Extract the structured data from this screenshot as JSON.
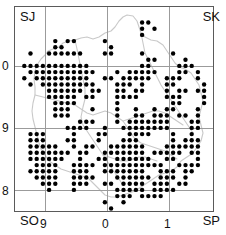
{
  "map": {
    "title": "Species distribution dot map",
    "quadrant_labels": {
      "top_left": "SJ",
      "top_right": "SK",
      "bottom_left": "SO",
      "bottom_right": "SP"
    },
    "axes": {
      "y_ticks": [
        "0",
        "9",
        "8"
      ],
      "x_ticks": [
        "9",
        "0",
        "1"
      ],
      "x_label": "",
      "y_label": ""
    },
    "style": {
      "dot_color": "#000000",
      "grid_color": "#9b9b9b",
      "frame_color": "#5a5a5a",
      "boundary_color": "#c8c8c8",
      "background": "#ffffff"
    }
  },
  "chart_data": {
    "type": "scatter",
    "xlabel": "",
    "ylabel": "",
    "grid": true,
    "legend": null,
    "xlim": [
      0,
      32
    ],
    "ylim": [
      0,
      33
    ],
    "x_tick_values": [
      5,
      15,
      25
    ],
    "x_tick_labels": [
      "9",
      "0",
      "1"
    ],
    "y_tick_values": [
      9,
      19,
      29
    ],
    "y_tick_labels": [
      "0",
      "9",
      "8"
    ],
    "grid_cell_px": 6.2,
    "marker": "filled-circle",
    "marker_size_px": 4.4,
    "points": [
      [
        20,
        2
      ],
      [
        21,
        2
      ],
      [
        20,
        3
      ],
      [
        22,
        3
      ],
      [
        20,
        4
      ],
      [
        6,
        5
      ],
      [
        8,
        5
      ],
      [
        9,
        5
      ],
      [
        14,
        5
      ],
      [
        6,
        6
      ],
      [
        7,
        6
      ],
      [
        15,
        6
      ],
      [
        20,
        7
      ],
      [
        2,
        7
      ],
      [
        5,
        7
      ],
      [
        6,
        7
      ],
      [
        7,
        7
      ],
      [
        8,
        7
      ],
      [
        9,
        7
      ],
      [
        10,
        7
      ],
      [
        14,
        7
      ],
      [
        15,
        7
      ],
      [
        25,
        7
      ],
      [
        21,
        8
      ],
      [
        22,
        8
      ],
      [
        27,
        8
      ],
      [
        1,
        9
      ],
      [
        2,
        9
      ],
      [
        3,
        9
      ],
      [
        4,
        9
      ],
      [
        5,
        9
      ],
      [
        6,
        9
      ],
      [
        7,
        9
      ],
      [
        8,
        9
      ],
      [
        9,
        9
      ],
      [
        10,
        9
      ],
      [
        11,
        9
      ],
      [
        20,
        9
      ],
      [
        21,
        9
      ],
      [
        26,
        9
      ],
      [
        27,
        9
      ],
      [
        28,
        9
      ],
      [
        2,
        10
      ],
      [
        3,
        10
      ],
      [
        4,
        10
      ],
      [
        5,
        10
      ],
      [
        6,
        10
      ],
      [
        7,
        10
      ],
      [
        8,
        10
      ],
      [
        9,
        10
      ],
      [
        10,
        10
      ],
      [
        11,
        10
      ],
      [
        12,
        10
      ],
      [
        16,
        10
      ],
      [
        18,
        10
      ],
      [
        19,
        10
      ],
      [
        20,
        10
      ],
      [
        21,
        10
      ],
      [
        22,
        10
      ],
      [
        26,
        10
      ],
      [
        27,
        10
      ],
      [
        29,
        10
      ],
      [
        1,
        11
      ],
      [
        3,
        11
      ],
      [
        4,
        11
      ],
      [
        5,
        11
      ],
      [
        6,
        11
      ],
      [
        7,
        11
      ],
      [
        8,
        11
      ],
      [
        9,
        11
      ],
      [
        10,
        11
      ],
      [
        11,
        11
      ],
      [
        14,
        11
      ],
      [
        15,
        11
      ],
      [
        17,
        11
      ],
      [
        18,
        11
      ],
      [
        19,
        11
      ],
      [
        20,
        11
      ],
      [
        21,
        11
      ],
      [
        24,
        11
      ],
      [
        25,
        11
      ],
      [
        26,
        11
      ],
      [
        29,
        11
      ],
      [
        2,
        12
      ],
      [
        4,
        12
      ],
      [
        5,
        12
      ],
      [
        6,
        12
      ],
      [
        7,
        12
      ],
      [
        8,
        12
      ],
      [
        9,
        12
      ],
      [
        10,
        12
      ],
      [
        11,
        12
      ],
      [
        12,
        12
      ],
      [
        16,
        12
      ],
      [
        17,
        12
      ],
      [
        18,
        12
      ],
      [
        20,
        12
      ],
      [
        24,
        12
      ],
      [
        25,
        12
      ],
      [
        30,
        12
      ],
      [
        5,
        13
      ],
      [
        6,
        13
      ],
      [
        7,
        13
      ],
      [
        8,
        13
      ],
      [
        9,
        13
      ],
      [
        10,
        13
      ],
      [
        12,
        13
      ],
      [
        13,
        13
      ],
      [
        16,
        13
      ],
      [
        17,
        13
      ],
      [
        19,
        13
      ],
      [
        20,
        13
      ],
      [
        24,
        13
      ],
      [
        26,
        13
      ],
      [
        27,
        13
      ],
      [
        29,
        13
      ],
      [
        30,
        13
      ],
      [
        5,
        14
      ],
      [
        6,
        14
      ],
      [
        7,
        14
      ],
      [
        8,
        14
      ],
      [
        9,
        14
      ],
      [
        11,
        14
      ],
      [
        12,
        14
      ],
      [
        16,
        14
      ],
      [
        17,
        14
      ],
      [
        18,
        14
      ],
      [
        19,
        14
      ],
      [
        24,
        14
      ],
      [
        25,
        14
      ],
      [
        26,
        14
      ],
      [
        30,
        14
      ],
      [
        6,
        15
      ],
      [
        7,
        15
      ],
      [
        8,
        15
      ],
      [
        9,
        15
      ],
      [
        16,
        15
      ],
      [
        25,
        15
      ],
      [
        26,
        15
      ],
      [
        30,
        15
      ],
      [
        6,
        16
      ],
      [
        7,
        16
      ],
      [
        8,
        16
      ],
      [
        12,
        16
      ],
      [
        16,
        16
      ],
      [
        19,
        16
      ],
      [
        22,
        16
      ],
      [
        24,
        16
      ],
      [
        25,
        16
      ],
      [
        29,
        16
      ],
      [
        6,
        17
      ],
      [
        7,
        17
      ],
      [
        8,
        17
      ],
      [
        16,
        17
      ],
      [
        19,
        17
      ],
      [
        20,
        17
      ],
      [
        22,
        17
      ],
      [
        23,
        17
      ],
      [
        24,
        17
      ],
      [
        26,
        17
      ],
      [
        27,
        17
      ],
      [
        29,
        17
      ],
      [
        10,
        18
      ],
      [
        11,
        18
      ],
      [
        12,
        18
      ],
      [
        16,
        18
      ],
      [
        18,
        18
      ],
      [
        19,
        18
      ],
      [
        20,
        18
      ],
      [
        21,
        18
      ],
      [
        22,
        18
      ],
      [
        23,
        18
      ],
      [
        24,
        18
      ],
      [
        28,
        18
      ],
      [
        29,
        18
      ],
      [
        8,
        19
      ],
      [
        9,
        19
      ],
      [
        10,
        19
      ],
      [
        11,
        19
      ],
      [
        14,
        19
      ],
      [
        17,
        19
      ],
      [
        18,
        19
      ],
      [
        19,
        19
      ],
      [
        20,
        19
      ],
      [
        21,
        19
      ],
      [
        22,
        19
      ],
      [
        23,
        19
      ],
      [
        24,
        19
      ],
      [
        28,
        19
      ],
      [
        29,
        19
      ],
      [
        2,
        20
      ],
      [
        3,
        20
      ],
      [
        4,
        20
      ],
      [
        9,
        20
      ],
      [
        13,
        20
      ],
      [
        14,
        20
      ],
      [
        18,
        20
      ],
      [
        19,
        20
      ],
      [
        20,
        20
      ],
      [
        21,
        20
      ],
      [
        25,
        20
      ],
      [
        28,
        20
      ],
      [
        2,
        21
      ],
      [
        3,
        21
      ],
      [
        4,
        21
      ],
      [
        8,
        21
      ],
      [
        9,
        21
      ],
      [
        13,
        21
      ],
      [
        17,
        21
      ],
      [
        18,
        21
      ],
      [
        19,
        21
      ],
      [
        25,
        21
      ],
      [
        27,
        21
      ],
      [
        28,
        21
      ],
      [
        29,
        21
      ],
      [
        2,
        22
      ],
      [
        3,
        22
      ],
      [
        4,
        22
      ],
      [
        5,
        22
      ],
      [
        6,
        22
      ],
      [
        9,
        22
      ],
      [
        11,
        22
      ],
      [
        12,
        22
      ],
      [
        15,
        22
      ],
      [
        16,
        22
      ],
      [
        17,
        22
      ],
      [
        18,
        22
      ],
      [
        19,
        22
      ],
      [
        20,
        22
      ],
      [
        24,
        22
      ],
      [
        25,
        22
      ],
      [
        26,
        22
      ],
      [
        27,
        22
      ],
      [
        28,
        22
      ],
      [
        29,
        22
      ],
      [
        2,
        23
      ],
      [
        3,
        23
      ],
      [
        4,
        23
      ],
      [
        5,
        23
      ],
      [
        6,
        23
      ],
      [
        7,
        23
      ],
      [
        8,
        23
      ],
      [
        10,
        23
      ],
      [
        11,
        23
      ],
      [
        14,
        23
      ],
      [
        15,
        23
      ],
      [
        16,
        23
      ],
      [
        17,
        23
      ],
      [
        18,
        23
      ],
      [
        19,
        23
      ],
      [
        20,
        23
      ],
      [
        22,
        23
      ],
      [
        23,
        23
      ],
      [
        24,
        23
      ],
      [
        25,
        23
      ],
      [
        26,
        23
      ],
      [
        28,
        23
      ],
      [
        29,
        23
      ],
      [
        2,
        24
      ],
      [
        3,
        24
      ],
      [
        4,
        24
      ],
      [
        5,
        24
      ],
      [
        6,
        24
      ],
      [
        7,
        24
      ],
      [
        10,
        24
      ],
      [
        13,
        24
      ],
      [
        14,
        24
      ],
      [
        16,
        24
      ],
      [
        17,
        24
      ],
      [
        18,
        24
      ],
      [
        19,
        24
      ],
      [
        20,
        24
      ],
      [
        21,
        24
      ],
      [
        24,
        24
      ],
      [
        25,
        24
      ],
      [
        29,
        24
      ],
      [
        3,
        25
      ],
      [
        4,
        25
      ],
      [
        5,
        25
      ],
      [
        6,
        25
      ],
      [
        9,
        25
      ],
      [
        10,
        25
      ],
      [
        11,
        25
      ],
      [
        12,
        25
      ],
      [
        14,
        25
      ],
      [
        15,
        25
      ],
      [
        16,
        25
      ],
      [
        17,
        25
      ],
      [
        18,
        25
      ],
      [
        19,
        25
      ],
      [
        20,
        25
      ],
      [
        21,
        25
      ],
      [
        22,
        25
      ],
      [
        23,
        25
      ],
      [
        26,
        25
      ],
      [
        27,
        25
      ],
      [
        28,
        25
      ],
      [
        29,
        25
      ],
      [
        2,
        26
      ],
      [
        3,
        26
      ],
      [
        4,
        26
      ],
      [
        5,
        26
      ],
      [
        6,
        26
      ],
      [
        9,
        26
      ],
      [
        10,
        26
      ],
      [
        11,
        26
      ],
      [
        14,
        26
      ],
      [
        15,
        26
      ],
      [
        16,
        26
      ],
      [
        17,
        26
      ],
      [
        18,
        26
      ],
      [
        19,
        26
      ],
      [
        20,
        26
      ],
      [
        23,
        26
      ],
      [
        24,
        26
      ],
      [
        25,
        26
      ],
      [
        27,
        26
      ],
      [
        28,
        26
      ],
      [
        3,
        27
      ],
      [
        4,
        27
      ],
      [
        5,
        27
      ],
      [
        6,
        27
      ],
      [
        9,
        27
      ],
      [
        10,
        27
      ],
      [
        11,
        27
      ],
      [
        12,
        27
      ],
      [
        16,
        27
      ],
      [
        17,
        27
      ],
      [
        18,
        27
      ],
      [
        19,
        27
      ],
      [
        20,
        27
      ],
      [
        21,
        27
      ],
      [
        23,
        27
      ],
      [
        24,
        27
      ],
      [
        25,
        27
      ],
      [
        27,
        27
      ],
      [
        4,
        28
      ],
      [
        5,
        28
      ],
      [
        6,
        28
      ],
      [
        9,
        28
      ],
      [
        10,
        28
      ],
      [
        11,
        28
      ],
      [
        14,
        28
      ],
      [
        15,
        28
      ],
      [
        17,
        28
      ],
      [
        18,
        28
      ],
      [
        19,
        28
      ],
      [
        20,
        28
      ],
      [
        22,
        28
      ],
      [
        23,
        28
      ],
      [
        24,
        28
      ],
      [
        26,
        28
      ],
      [
        27,
        28
      ],
      [
        5,
        29
      ],
      [
        9,
        29
      ],
      [
        16,
        29
      ],
      [
        17,
        29
      ],
      [
        18,
        29
      ],
      [
        19,
        29
      ],
      [
        20,
        29
      ],
      [
        22,
        29
      ],
      [
        23,
        29
      ],
      [
        24,
        29
      ],
      [
        25,
        29
      ],
      [
        16,
        30
      ],
      [
        17,
        30
      ],
      [
        18,
        30
      ],
      [
        20,
        30
      ],
      [
        21,
        30
      ],
      [
        22,
        30
      ],
      [
        23,
        30
      ],
      [
        14,
        31
      ],
      [
        17,
        31
      ],
      [
        15,
        32
      ]
    ]
  }
}
